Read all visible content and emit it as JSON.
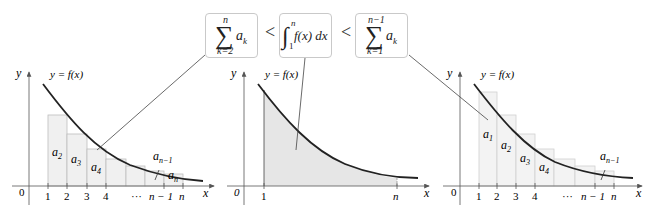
{
  "inequality": {
    "left_box": {
      "symbol": "∑",
      "upper": "n",
      "lower": "k=2",
      "term": "a",
      "term_sub": "k"
    },
    "less_than_1": "<",
    "middle_box": {
      "symbol": "∫",
      "upper": "n",
      "lower": "1",
      "expr": "f(x) dx"
    },
    "less_than_2": "<",
    "right_box": {
      "symbol": "∑",
      "upper": "n−1",
      "lower": "k=1",
      "term": "a",
      "term_sub": "k"
    }
  },
  "panels": {
    "left": {
      "y_label": "y",
      "x_label": "x",
      "origin_label": "0",
      "curve_label": "y = f(x)",
      "ticks": [
        "1",
        "2",
        "3",
        "4",
        "···",
        "n − 1",
        "n"
      ],
      "rect_labels": [
        {
          "base": "a",
          "sub": "2"
        },
        {
          "base": "a",
          "sub": "3"
        },
        {
          "base": "a",
          "sub": "4"
        },
        {
          "base": "a",
          "sub": "n−1"
        },
        {
          "base": "a",
          "sub": "n"
        }
      ]
    },
    "middle": {
      "y_label": "y",
      "x_label": "x",
      "origin_label": "0",
      "curve_label": "y = f(x)",
      "ticks": [
        "1",
        "n"
      ]
    },
    "right": {
      "y_label": "y",
      "x_label": "x",
      "origin_label": "0",
      "curve_label": "y = f(x)",
      "ticks": [
        "1",
        "2",
        "3",
        "4",
        "···",
        "n − 1",
        "n"
      ],
      "rect_labels": [
        {
          "base": "a",
          "sub": "1"
        },
        {
          "base": "a",
          "sub": "2"
        },
        {
          "base": "a",
          "sub": "3"
        },
        {
          "base": "a",
          "sub": "4"
        },
        {
          "base": "a",
          "sub": "n−1"
        }
      ]
    }
  },
  "colors": {
    "curve": "#222222",
    "axis": "#555555",
    "rect_fill": "#f0f0f0",
    "rect_stroke": "#bdbdbd",
    "area_fill": "#e6e6e6",
    "box_border": "#c9c9c9"
  }
}
